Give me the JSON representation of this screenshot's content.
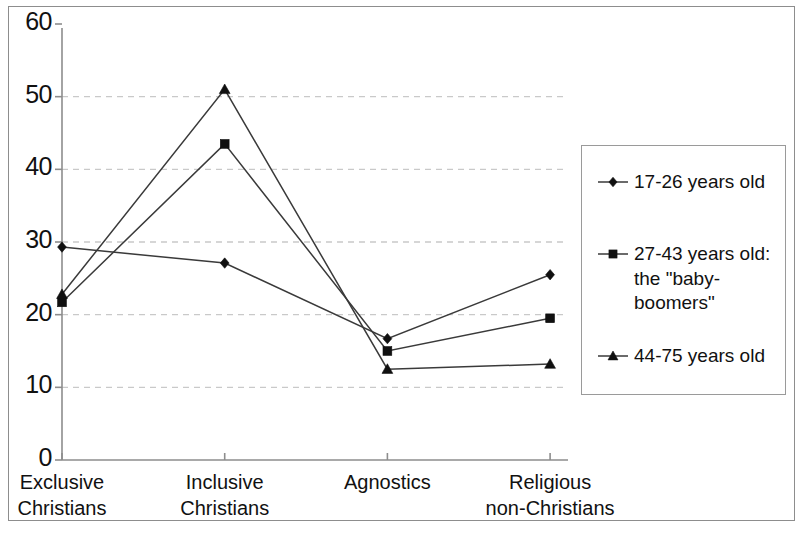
{
  "chart_data": {
    "type": "line",
    "title": "",
    "xlabel": "",
    "ylabel": "",
    "ylim": [
      0,
      60
    ],
    "ytick_labels": [
      "0",
      "10",
      "20",
      "30",
      "40",
      "50",
      "60"
    ],
    "yticks": [
      0,
      10,
      20,
      30,
      40,
      50,
      60
    ],
    "grid": "horizontal-dashed",
    "legend_position": "right-outside",
    "categories": [
      "Exclusive\nChristians",
      "Inclusive\nChristians",
      "Agnostics",
      "Religious\nnon-Christians"
    ],
    "series": [
      {
        "name": "17-26 years old",
        "marker": "diamond",
        "values": [
          29.3,
          27.1,
          16.7,
          25.5
        ]
      },
      {
        "name": "27-43 years old:\nthe \"baby-boomers\"",
        "marker": "square",
        "values": [
          21.7,
          43.5,
          15.0,
          19.5
        ]
      },
      {
        "name": "44-75 years old",
        "marker": "triangle",
        "values": [
          22.8,
          51.0,
          12.5,
          13.2
        ]
      }
    ]
  },
  "legend": {
    "entries": [
      {
        "label": "17-26 years old",
        "marker": "diamond-marker-icon"
      },
      {
        "label": "27-43 years old:\nthe \"baby-boomers\"",
        "marker": "square-marker-icon"
      },
      {
        "label": "44-75 years old",
        "marker": "triangle-marker-icon"
      }
    ]
  },
  "colors": {
    "line": "#3a3a3a",
    "marker": "#101010",
    "grid": "#c9c9c9",
    "axis": "#8d8d8d",
    "frame": "#8d8d8d",
    "background": "#ffffff"
  }
}
